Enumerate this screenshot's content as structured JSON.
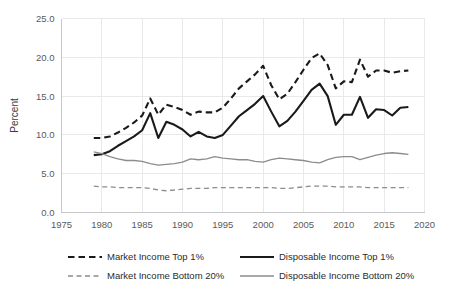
{
  "chart_data": {
    "type": "line",
    "title": "",
    "xlabel": "",
    "ylabel": "Percent",
    "xlim": [
      1975,
      2020
    ],
    "ylim": [
      0.0,
      25.0
    ],
    "xticks": [
      1975,
      1980,
      1985,
      1990,
      1995,
      2000,
      2005,
      2010,
      2015,
      2020
    ],
    "xtick_labels": [
      "1975",
      "1980",
      "1985",
      "1990",
      "1995",
      "2000",
      "2005",
      "2010",
      "2015",
      "2020"
    ],
    "yticks": [
      0.0,
      5.0,
      10.0,
      15.0,
      20.0,
      25.0
    ],
    "ytick_labels": [
      "0.0",
      "5.0",
      "10.0",
      "15.0",
      "20.0",
      "25.0"
    ],
    "grid": true,
    "legend_position": "bottom",
    "x": [
      1979,
      1980,
      1981,
      1982,
      1983,
      1984,
      1985,
      1986,
      1987,
      1988,
      1989,
      1990,
      1991,
      1992,
      1993,
      1994,
      1995,
      1996,
      1997,
      1998,
      1999,
      2000,
      2001,
      2002,
      2003,
      2004,
      2005,
      2006,
      2007,
      2008,
      2009,
      2010,
      2011,
      2012,
      2013,
      2014,
      2015,
      2016,
      2017,
      2018
    ],
    "series": [
      {
        "name": "Market Income Top 1%",
        "style": "dashed",
        "color": "#1a1a1a",
        "width": 2.1,
        "values": [
          9.6,
          9.6,
          9.8,
          10.3,
          10.9,
          11.6,
          12.5,
          14.7,
          12.6,
          13.9,
          13.6,
          13.2,
          12.6,
          13.0,
          12.9,
          12.9,
          13.5,
          14.7,
          16.0,
          16.9,
          17.8,
          18.9,
          16.4,
          14.6,
          15.3,
          16.8,
          18.4,
          19.9,
          20.5,
          19.0,
          16.0,
          16.9,
          16.8,
          19.7,
          17.5,
          18.3,
          18.3,
          18.0,
          18.2,
          18.3
        ]
      },
      {
        "name": "Disposable Income Top 1%",
        "style": "solid",
        "color": "#1a1a1a",
        "width": 2.1,
        "values": [
          7.4,
          7.5,
          7.9,
          8.6,
          9.2,
          9.8,
          10.6,
          12.8,
          9.6,
          11.7,
          11.3,
          10.7,
          9.8,
          10.4,
          9.8,
          9.6,
          10.0,
          11.2,
          12.4,
          13.2,
          14.0,
          15.0,
          13.0,
          11.1,
          11.8,
          13.0,
          14.4,
          15.8,
          16.6,
          15.0,
          11.3,
          12.6,
          12.6,
          14.9,
          12.2,
          13.3,
          13.2,
          12.5,
          13.5,
          13.6
        ]
      },
      {
        "name": "Market Income Bottom 20%",
        "style": "dashed",
        "color": "#8c8c8c",
        "width": 1.3,
        "values": [
          3.4,
          3.3,
          3.3,
          3.2,
          3.2,
          3.2,
          3.2,
          3.1,
          2.9,
          2.8,
          2.9,
          3.0,
          3.1,
          3.1,
          3.1,
          3.2,
          3.2,
          3.2,
          3.2,
          3.2,
          3.2,
          3.2,
          3.2,
          3.1,
          3.1,
          3.2,
          3.3,
          3.4,
          3.4,
          3.4,
          3.3,
          3.3,
          3.3,
          3.3,
          3.2,
          3.2,
          3.2,
          3.2,
          3.2,
          3.2
        ]
      },
      {
        "name": "Disposable Income Bottom 20%",
        "style": "solid",
        "color": "#8c8c8c",
        "width": 1.3,
        "values": [
          7.8,
          7.6,
          7.2,
          6.9,
          6.7,
          6.7,
          6.6,
          6.3,
          6.1,
          6.2,
          6.3,
          6.5,
          6.9,
          6.8,
          6.9,
          7.2,
          7.0,
          6.9,
          6.8,
          6.8,
          6.6,
          6.5,
          6.8,
          7.0,
          6.9,
          6.8,
          6.7,
          6.5,
          6.4,
          6.8,
          7.1,
          7.2,
          7.2,
          6.8,
          7.1,
          7.4,
          7.6,
          7.7,
          7.6,
          7.5
        ]
      }
    ]
  },
  "legend": {
    "items": [
      {
        "label": "Market Income Top 1%"
      },
      {
        "label": "Disposable Income Top 1%"
      },
      {
        "label": "Market Income Bottom 20%"
      },
      {
        "label": "Disposable Income Bottom 20%"
      }
    ]
  }
}
